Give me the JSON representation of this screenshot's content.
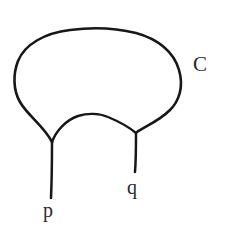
{
  "figure": {
    "kind": "hand-drawn-curve-diagram",
    "background_color": "#ffffff",
    "ink_color": "#171717",
    "width": 227,
    "height": 239,
    "labels": {
      "curve": "C",
      "left_tail": "p",
      "right_tail": "q"
    },
    "geometry": {
      "loop_top_y": 29,
      "loop_left_x": 15,
      "loop_right_x": 179,
      "left_cusp": [
        52,
        143
      ],
      "right_cusp": [
        136,
        133
      ],
      "inner_arc_peak": [
        93,
        114
      ],
      "left_tail_end": [
        52,
        198
      ],
      "right_tail_end": [
        136,
        172
      ]
    },
    "label_positions": {
      "curve": [
        202,
        70
      ],
      "left_tail": [
        50,
        213
      ],
      "right_tail": [
        134,
        190
      ]
    }
  }
}
